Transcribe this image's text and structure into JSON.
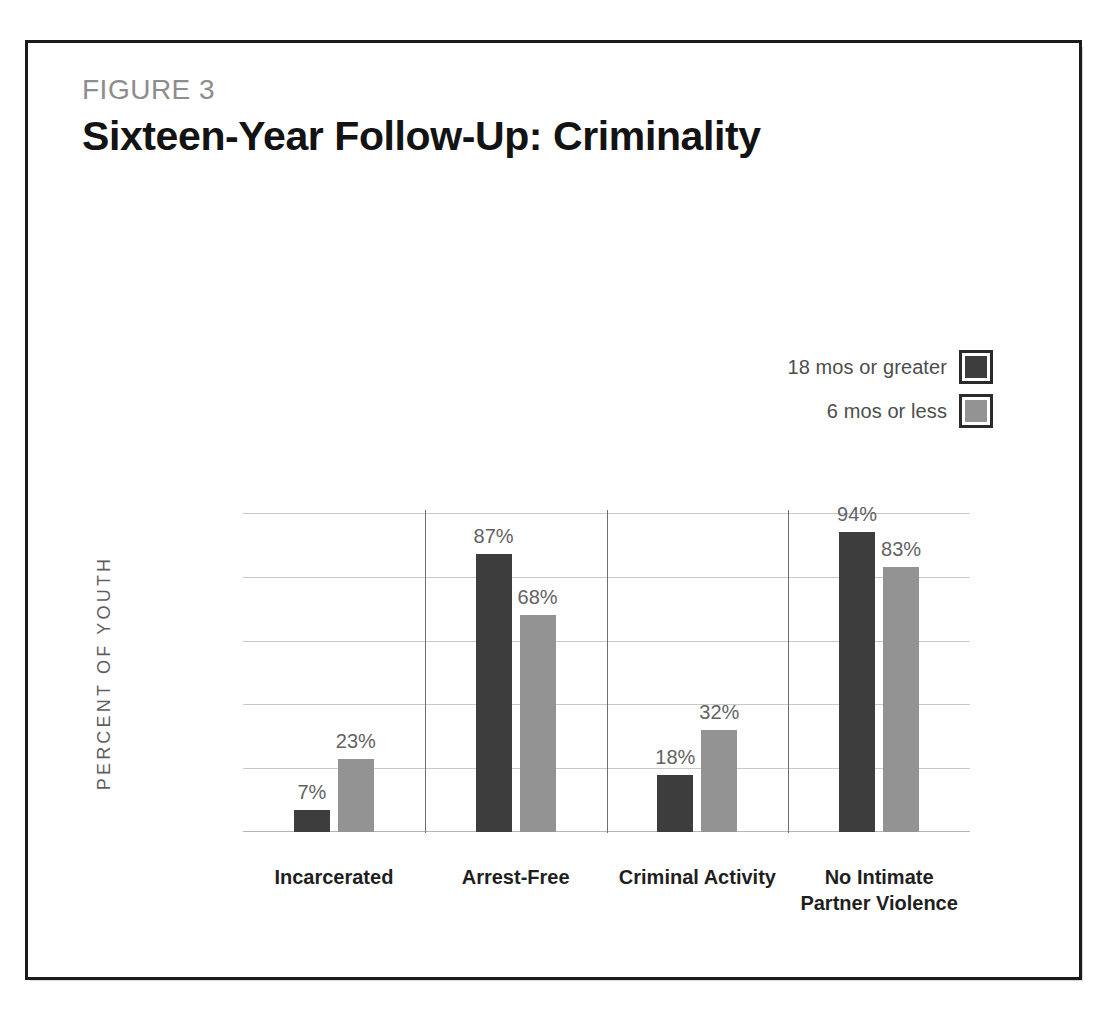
{
  "figure": {
    "kicker": "FIGURE 3",
    "title": "Sixteen-Year Follow-Up: Criminality"
  },
  "legend": {
    "position": "top-right",
    "items": [
      {
        "label": "18 mos or greater",
        "color": "#3d3d3d"
      },
      {
        "label": "6 mos or less",
        "color": "#939393"
      }
    ]
  },
  "axis": {
    "y_title": "PERCENT OF YOUTH",
    "ticks": [
      "100%",
      "80%",
      "60%",
      "40%",
      "20%",
      "0"
    ]
  },
  "chart_data": {
    "type": "bar",
    "title": "Sixteen-Year Follow-Up: Criminality",
    "xlabel": "",
    "ylabel": "PERCENT OF YOUTH",
    "ylim": [
      0,
      100
    ],
    "yticks": [
      0,
      20,
      40,
      60,
      80,
      100
    ],
    "ytick_labels": [
      "0",
      "20%",
      "40%",
      "60%",
      "80%",
      "100%"
    ],
    "grid": true,
    "legend_position": "top-right",
    "categories": [
      "Incarcerated",
      "Arrest-Free",
      "Criminal Activity",
      "No Intimate Partner Violence"
    ],
    "series": [
      {
        "name": "18 mos or greater",
        "color": "#3d3d3d",
        "values": [
          7,
          87,
          18,
          94
        ],
        "labels": [
          "7%",
          "87%",
          "18%",
          "94%"
        ]
      },
      {
        "name": "6 mos or less",
        "color": "#939393",
        "values": [
          23,
          68,
          32,
          83
        ],
        "labels": [
          "23%",
          "68%",
          "32%",
          "83%"
        ]
      }
    ]
  },
  "category_lines": [
    [
      "Incarcerated"
    ],
    [
      "Arrest-Free"
    ],
    [
      "Criminal Activity"
    ],
    [
      "No Intimate",
      "Partner Violence"
    ]
  ]
}
